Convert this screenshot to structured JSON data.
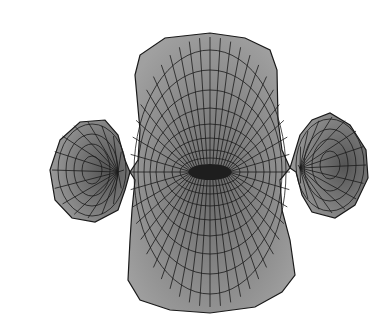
{
  "image": {
    "subject": "3D wireframe mesh surface with central saddle and two side lobes",
    "background": "#ffffff",
    "fill_colors": {
      "face": "#8a8a8a",
      "face_light": "#a8a8a8",
      "face_dark": "#4a4a4a",
      "line": "#1a1a1a"
    }
  }
}
